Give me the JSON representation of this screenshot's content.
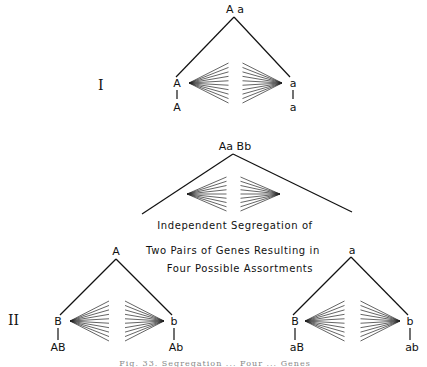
{
  "part1": {
    "numeral": "I",
    "parent": "A a",
    "left_allele": "A",
    "left_result": "A",
    "right_allele": "a",
    "right_result": "a"
  },
  "part2": {
    "numeral": "II",
    "parent": "Aa Bb",
    "caption_lines": [
      "Independent  Segregation  of",
      "Two  Pairs  of  Genes  Resulting  in",
      "Four  Possible  Assortments"
    ],
    "left_branch": {
      "allele": "A",
      "left_allele": "B",
      "left_result": "AB",
      "right_allele": "b",
      "right_result": "Ab"
    },
    "right_branch": {
      "allele": "a",
      "left_allele": "B",
      "left_result": "aB",
      "right_allele": "b",
      "right_result": "ab"
    }
  },
  "figure_caption": "Fig. 33. Segregation ... Four ... Genes"
}
